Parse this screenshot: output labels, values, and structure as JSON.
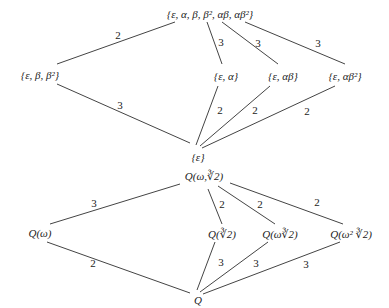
{
  "top_lattice": {
    "nodes": {
      "g": "{ε, α, β, β², αβ, αβ²}",
      "b": "{ε,  β, β²}",
      "a": "{ε, α}",
      "ab": "{ε, αβ}",
      "ab2": "{ε, αβ²}",
      "e": "{ε}"
    },
    "labels": [
      "2",
      "3",
      "3",
      "3",
      "3",
      "3",
      "2",
      "2",
      "2"
    ]
  },
  "bottom_lattice": {
    "nodes": {
      "top": "Q(ω,∛2)",
      "w": "Q(ω)",
      "c1": "Q(∛2)",
      "c2": "Q(ω∛2)",
      "c3": "Q(ω² ∛2)",
      "q": "Q"
    },
    "labels": [
      "3",
      "2",
      "2",
      "2",
      "2",
      "3",
      "3",
      "3"
    ]
  }
}
